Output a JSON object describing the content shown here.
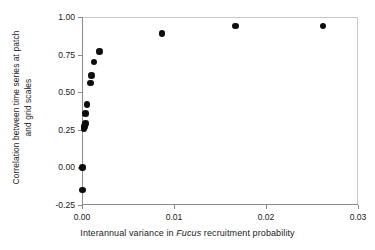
{
  "chart_data": {
    "type": "scatter",
    "title": "",
    "xlabel_parts": {
      "before": "Interannual variance in ",
      "italic": "Fucus",
      "after": " recruitment probability"
    },
    "xlabel": "Interannual variance in Fucus recruitment probability",
    "ylabel_line1": "Correlation between time series at patch",
    "ylabel_line2": "and grid scales",
    "ylabel": "Correlation between time series at patch and grid scales",
    "xlim": [
      0.0,
      0.03
    ],
    "ylim": [
      -0.25,
      1.0
    ],
    "xticks": [
      0.0,
      0.01,
      0.02,
      0.03
    ],
    "xtick_labels": [
      "0.00",
      "0.01",
      "0.02",
      "0.03"
    ],
    "yticks": [
      -0.25,
      0.0,
      0.25,
      0.5,
      0.75,
      1.0
    ],
    "ytick_labels": [
      "-0.25",
      "0.00",
      "0.25",
      "0.50",
      "0.75",
      "1.00"
    ],
    "grid": false,
    "legend": null,
    "marker": "filled-circle",
    "marker_color": "#0d0d0d",
    "axis_color": "#8a8a8a",
    "points": [
      {
        "x": 5e-05,
        "y": -0.15
      },
      {
        "x": 5e-05,
        "y": 0.0
      },
      {
        "x": 0.0002,
        "y": 0.26
      },
      {
        "x": 0.0003,
        "y": 0.27
      },
      {
        "x": 0.00035,
        "y": 0.29
      },
      {
        "x": 0.0004,
        "y": 0.36
      },
      {
        "x": 0.00055,
        "y": 0.42
      },
      {
        "x": 0.0009,
        "y": 0.56
      },
      {
        "x": 0.00105,
        "y": 0.61
      },
      {
        "x": 0.0013,
        "y": 0.7
      },
      {
        "x": 0.0019,
        "y": 0.77
      },
      {
        "x": 0.0087,
        "y": 0.89
      },
      {
        "x": 0.0167,
        "y": 0.94
      },
      {
        "x": 0.0262,
        "y": 0.94
      }
    ]
  }
}
